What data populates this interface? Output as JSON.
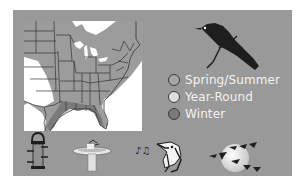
{
  "illustration": {
    "subject": "bird range map",
    "map": {
      "region": "Eastern United States",
      "land_color": "#999999",
      "border_color": "#333333",
      "background_color": "#ffffff"
    },
    "bird_icon": "bird-silhouette-icon"
  },
  "legend": {
    "items": [
      {
        "label": "Spring/Summer",
        "color": "#a6a6a6"
      },
      {
        "label": "Year-Round",
        "color": "#dedede"
      },
      {
        "label": "Winter",
        "color": "#7a7a7a"
      }
    ]
  },
  "icons": [
    {
      "name": "bird-feeder-icon"
    },
    {
      "name": "bird-bath-icon"
    },
    {
      "name": "singing-bird-icon"
    },
    {
      "name": "migrating-flock-icon"
    }
  ],
  "colors": {
    "panel": "#999999",
    "legend_text": "#f2f2f2",
    "silhouette": "#1e1e1e"
  }
}
